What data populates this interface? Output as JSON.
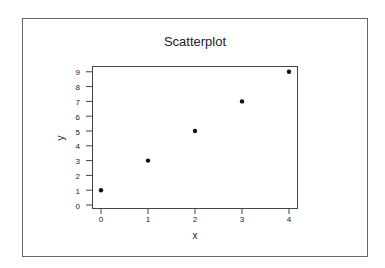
{
  "chart_data": {
    "type": "scatter",
    "title": "Scatterplot",
    "xlabel": "x",
    "ylabel": "y",
    "x": [
      0,
      1,
      2,
      3,
      4
    ],
    "y": [
      1,
      3,
      5,
      7,
      9
    ],
    "series": [
      {
        "name": "y",
        "x": [
          0,
          1,
          2,
          3,
          4
        ],
        "values": [
          1,
          3,
          5,
          7,
          9
        ]
      }
    ],
    "xticks": [
      "0",
      "1",
      "2",
      "3",
      "4"
    ],
    "yticks": [
      "0",
      "1",
      "2",
      "3",
      "4",
      "5",
      "6",
      "7",
      "8",
      "9"
    ],
    "xlim": [
      -0.2,
      4.2
    ],
    "ylim": [
      -0.2,
      9.4
    ],
    "grid": false,
    "legend": null,
    "marker_color": "#111111",
    "frame_color": "#555555"
  }
}
